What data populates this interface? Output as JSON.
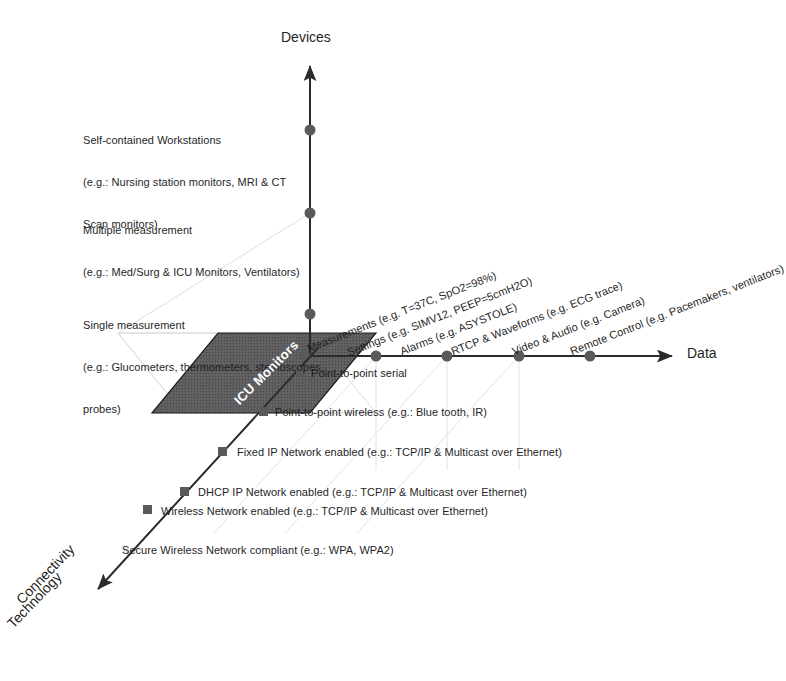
{
  "axes": {
    "y": {
      "title": "Devices",
      "ticks": [
        {
          "id": "self-contained-workstations",
          "lines": [
            "Self-contained Workstations",
            "(e.g.: Nursing station monitors, MRI & CT",
            "Scan monitors)"
          ]
        },
        {
          "id": "multiple-measurement",
          "lines": [
            "Multiple measurement",
            "(e.g.: Med/Surg & ICU Monitors, Ventilators)"
          ]
        },
        {
          "id": "single-measurement",
          "lines": [
            "Single measurement",
            "(e.g.: Glucometers, thermometers, stethoscopes,",
            "probes)"
          ]
        }
      ]
    },
    "x": {
      "title": "Data",
      "ticks": [
        {
          "id": "measurements",
          "label": "Measurements (e.g. T=37C, SpO2=98%)"
        },
        {
          "id": "settings",
          "label": "Settings (e.g. SIMV12, PEEP=5cmH2O)"
        },
        {
          "id": "alarms",
          "label": "Alarms (e.g. ASYSTOLE)"
        },
        {
          "id": "rtcp-waveforms",
          "label": "RTCP & Waveforms (e.g. ECG trace)"
        },
        {
          "id": "video-audio",
          "label": "Video & Audio (e.g. Camera)"
        },
        {
          "id": "remote-control",
          "label": "Remote Control (e.g. Pacemakers, ventilators)"
        }
      ]
    },
    "z": {
      "title_line1": "Connectivity",
      "title_line2": "Technology",
      "ticks": [
        {
          "id": "point-to-point-serial",
          "label": "Point-to-point serial"
        },
        {
          "id": "point-to-point-wireless",
          "label": "Point-to-point wireless (e.g.: Blue tooth, IR)"
        },
        {
          "id": "fixed-ip-network",
          "label": "Fixed IP Network enabled (e.g.: TCP/IP & Multicast over Ethernet)"
        },
        {
          "id": "dhcp-ip-network",
          "label": "DHCP IP Network enabled (e.g.: TCP/IP & Multicast over Ethernet)"
        },
        {
          "id": "wireless-network",
          "label": "Wireless Network enabled (e.g.: TCP/IP & Multicast over Ethernet)"
        },
        {
          "id": "secure-wireless-network",
          "label": "Secure Wireless Network compliant (e.g.: WPA, WPA2)"
        }
      ]
    }
  },
  "region": {
    "label": "ICU Monitors"
  },
  "colors": {
    "axis": "#2b2b2b",
    "dot": "#5a5a5c",
    "region_fill": "#5c5c5e",
    "region_stroke": "#202020",
    "grid": "#d8d8d8",
    "text": "#1f1f1f",
    "region_text": "#ffffff"
  }
}
